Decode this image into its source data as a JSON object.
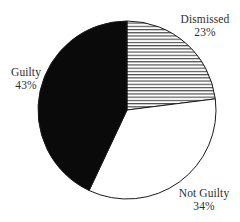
{
  "chart_data": {
    "type": "pie",
    "title": "",
    "subtitle": "",
    "xlabel": "",
    "ylabel": "",
    "legend_position": "none",
    "grid": false,
    "labels_outside": true,
    "start_angle_deg": 0,
    "direction": "clockwise",
    "categories": [
      "Dismissed",
      "Not Guilty",
      "Guilty"
    ],
    "values": [
      23,
      34,
      43
    ],
    "value_unit": "%",
    "slices": [
      {
        "label": "Dismissed",
        "percent_text": "23%",
        "value": 23,
        "fill_style": "horizontal-hatch",
        "fill_color": "#ffffff",
        "hatch_color": "#4a4a4a",
        "outline_color": "#1a1a1a",
        "start_angle_deg": 0,
        "end_angle_deg": 82.8
      },
      {
        "label": "Not Guilty",
        "percent_text": "34%",
        "value": 34,
        "fill_style": "solid",
        "fill_color": "#ffffff",
        "hatch_color": "",
        "outline_color": "#1a1a1a",
        "start_angle_deg": 82.8,
        "end_angle_deg": 205.2
      },
      {
        "label": "Guilty",
        "percent_text": "43%",
        "value": 43,
        "fill_style": "solid",
        "fill_color": "#0a0a0a",
        "hatch_color": "",
        "outline_color": "#1a1a1a",
        "start_angle_deg": 205.2,
        "end_angle_deg": 360
      }
    ],
    "geometry": {
      "center_x": 127,
      "center_y": 110,
      "radius": 89
    },
    "colors": {
      "background": "#ffffff",
      "text": "#2e2e2e",
      "outline": "#1a1a1a",
      "guilty_fill": "#0a0a0a",
      "dismissed_hatch": "#4a4a4a",
      "notguilty_fill": "#ffffff"
    }
  }
}
